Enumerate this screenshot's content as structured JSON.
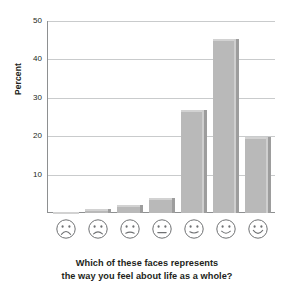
{
  "chart_data": {
    "type": "bar",
    "title": "",
    "subtitle": "",
    "xlabel": "Which of these faces represents the way you feel about life as a whole?",
    "ylabel": "Percent",
    "categories": [
      "very-unhappy-face",
      "unhappy-face",
      "slightly-unhappy-face",
      "neutral-face",
      "slightly-happy-face",
      "happy-face",
      "very-happy-face"
    ],
    "category_labels": [
      "face-1-frown-strong",
      "face-2-frown",
      "face-3-frown-slight",
      "face-4-neutral",
      "face-5-smile-slight",
      "face-6-smile",
      "face-7-smile-strong"
    ],
    "values": [
      0.2,
      1,
      2,
      4,
      27,
      45.5,
      20
    ],
    "ylim": [
      0,
      50
    ],
    "yticks": [
      10,
      20,
      30,
      40,
      50
    ],
    "ytick_labels": [
      "10",
      "20",
      "30",
      "40",
      "50"
    ],
    "grid": true,
    "legend": "none",
    "bar_color": "#b9b9b9",
    "bar_edge_color": "#9d9d9d",
    "grid_color": "#c9cbcc",
    "axis_color": "#8e9091",
    "text_color": "#231f20"
  },
  "axis": {
    "y_title": "Percent",
    "ticks": [
      {
        "label": "50",
        "value": 50
      },
      {
        "label": "40",
        "value": 40
      },
      {
        "label": "30",
        "value": 30
      },
      {
        "label": "20",
        "value": 20
      },
      {
        "label": "10",
        "value": 10
      }
    ]
  },
  "caption": {
    "line1": "Which of these faces represents",
    "line2": "the way you feel about life as a whole?"
  }
}
